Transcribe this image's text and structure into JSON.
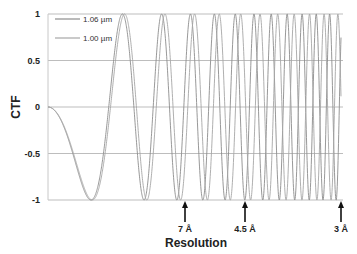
{
  "chart_data": {
    "type": "line",
    "title": "",
    "xlabel": "Resolution",
    "ylabel": "CTF",
    "ylim": [
      -1,
      1
    ],
    "yticks": [
      1,
      0.5,
      0,
      -0.5,
      -1
    ],
    "ytick_labels": [
      "1",
      "0.5",
      "0",
      "-0.5",
      "-1"
    ],
    "grid": "horizontal",
    "legend_position": "upper-left",
    "series": [
      {
        "name": "1.06 µm",
        "color": "#8c8c8c",
        "phase_scale": 73.1
      },
      {
        "name": "1.00 µm",
        "color": "#a6a6a6",
        "phase_scale": 69.0
      }
    ],
    "function": "CTF = -sin(phase_scale * x^2), x = normalized spatial frequency (0 to 1 at 3 Å)",
    "annotations": [
      {
        "label": "7 Å",
        "x_px": 185
      },
      {
        "label": "4.5 Å",
        "x_px": 245
      },
      {
        "label": "3 Å",
        "x_px": 341
      }
    ]
  }
}
